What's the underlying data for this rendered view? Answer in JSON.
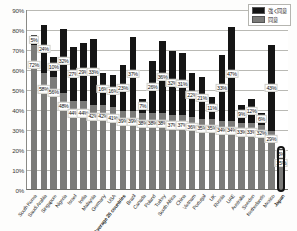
{
  "chart_data": {
    "type": "bar",
    "stacked": true,
    "title": "",
    "xlabel": "",
    "ylabel": "",
    "ylim": [
      0,
      90
    ],
    "ytick_labels": [
      "0%",
      "10%",
      "20%",
      "30%",
      "40%",
      "50%",
      "60%",
      "70%",
      "80%",
      "90%"
    ],
    "ytick_values": [
      0,
      10,
      20,
      30,
      40,
      50,
      60,
      70,
      80,
      90
    ],
    "grid": true,
    "legend_position": "top-right",
    "categories": [
      "South Korea",
      "Saudi Arabia",
      "Singapore",
      "Nigeria",
      "Israel",
      "India",
      "Malaysia",
      "Germany",
      "USA",
      "Average 26 countries",
      "Brazil",
      "Canada",
      "Poland",
      "Turkey",
      "South Africa",
      "China",
      "Vietnam",
      "Portugal",
      "UK",
      "Russia",
      "UAE",
      "Australia",
      "Sweden",
      "Netherlands",
      "Mexico",
      "Japan"
    ],
    "series": [
      {
        "name": "強く同意",
        "color": "#151515",
        "values": [
          5,
          24,
          10,
          32,
          27,
          29,
          33,
          16,
          16,
          23,
          37,
          7,
          26,
          36,
          32,
          31,
          22,
          21,
          11,
          33,
          47,
          9,
          12,
          6,
          43,
          5
        ]
      },
      {
        "name": "同意",
        "color": "#7b7b79",
        "values": [
          72,
          58,
          56,
          48,
          44,
          44,
          42,
          42,
          41,
          39,
          39,
          38,
          38,
          38,
          37,
          37,
          36,
          35,
          35,
          34,
          34,
          33,
          33,
          32,
          29,
          15
        ]
      }
    ],
    "value_labels_top": [
      "5%",
      "24%",
      "10%",
      "32%",
      "27%",
      "29%",
      "33%",
      "16%",
      "16%",
      "23%",
      "37%",
      "7%",
      "26%",
      "36%",
      "32%",
      "31%",
      "22%",
      "21%",
      "11%",
      "33%",
      "47%",
      "9%",
      "12%",
      "6%",
      "43%",
      "5%"
    ],
    "value_labels_bottom": [
      "72%",
      "58%",
      "56%",
      "48%",
      "44%",
      "44%",
      "42%",
      "42%",
      "41%",
      "39%",
      "39%",
      "38%",
      "38%",
      "38%",
      "37%",
      "37%",
      "36%",
      "35%",
      "35%",
      "34%",
      "34%",
      "33%",
      "33%",
      "32%",
      "29%",
      "15%"
    ],
    "highlighted_category": "Japan"
  },
  "legend": {
    "items": [
      {
        "label": "強く同意",
        "color": "#151515"
      },
      {
        "label": "同意",
        "color": "#7b7b79"
      }
    ]
  }
}
